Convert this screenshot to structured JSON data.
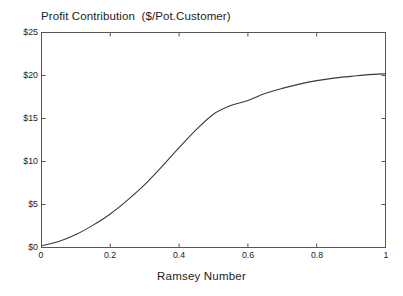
{
  "chart_data": {
    "type": "line",
    "title": "Profit Contribution  ($/Pot.Customer)",
    "xlabel": "Ramsey Number",
    "ylabel": "",
    "xlim": [
      0,
      1
    ],
    "ylim": [
      0,
      25
    ],
    "grid": false,
    "legend": null,
    "x_tick_labels": [
      "0",
      "0.2",
      "0.4",
      "0.6",
      "0.8",
      "1"
    ],
    "x_tick_values": [
      0,
      0.2,
      0.4,
      0.6,
      0.8,
      1
    ],
    "y_tick_labels": [
      "$0",
      "$5",
      "$10",
      "$15",
      "$20",
      "$25"
    ],
    "y_tick_values": [
      0,
      5,
      10,
      15,
      20,
      25
    ],
    "series": [
      {
        "name": "Profit Contribution",
        "color": "#3a3a3a",
        "x": [
          0,
          0.05,
          0.1,
          0.15,
          0.2,
          0.25,
          0.3,
          0.35,
          0.4,
          0.45,
          0.5,
          0.55,
          0.6,
          0.65,
          0.7,
          0.75,
          0.8,
          0.85,
          0.9,
          0.95,
          1
        ],
        "values": [
          0.2,
          0.7,
          1.5,
          2.6,
          3.9,
          5.5,
          7.3,
          9.4,
          11.6,
          13.7,
          15.5,
          16.5,
          17.1,
          17.9,
          18.5,
          19.0,
          19.4,
          19.7,
          19.9,
          20.1,
          20.2
        ]
      }
    ]
  },
  "figure": {
    "title": "Profit Contribution  ($/Pot.Customer)",
    "xlabel": "Ramsey Number",
    "background_color": "#ffffff",
    "axis_color": "#555555",
    "curve_color": "#3a3a3a"
  }
}
